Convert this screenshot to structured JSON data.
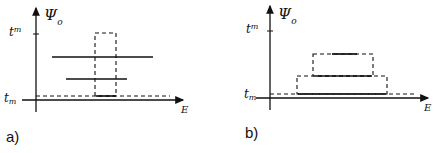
{
  "panels": [
    {
      "id": "a",
      "caption": "a)",
      "y_axis_label": "Ψ",
      "y_axis_sub": "o",
      "x_axis_label": "E",
      "upper_tick_label": "t",
      "upper_tick_sup": "m",
      "lower_tick_label": "t",
      "lower_tick_sub": "m"
    },
    {
      "id": "b",
      "caption": "b)",
      "y_axis_label": "Ψ",
      "y_axis_sub": "o",
      "x_axis_label": "E",
      "upper_tick_label": "t",
      "upper_tick_sup": "m",
      "lower_tick_label": "t",
      "lower_tick_sub": "m"
    }
  ],
  "colors": {
    "ink": "#111111",
    "background": "#ffffff"
  }
}
